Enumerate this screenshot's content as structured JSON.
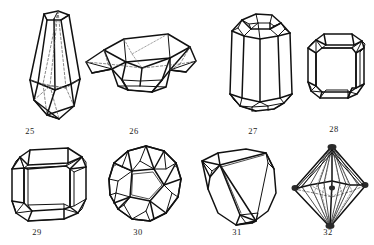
{
  "plate": {
    "title": "Crystal habit line drawings plate",
    "background_color": "#ffffff",
    "ink_color": "#111111",
    "hidden_edge_color": "#666666",
    "width": 374,
    "height": 245,
    "rows": 2,
    "columns": 4,
    "figure_count": 8
  },
  "figures": [
    {
      "number": "25",
      "caption": "25",
      "name": "elongated-dipyramidal-crystal",
      "description": "Tall tapering prismatic crystal with pyramidal termination and hidden rear edges shown dashed",
      "row": 1,
      "column": 1,
      "caption_x": 30,
      "caption_y": 130
    },
    {
      "number": "26",
      "caption": "26",
      "name": "tabular-lenticular-crystal",
      "description": "Wide flattened tabular crystal seen edgewise with beveled faces and dashed interior edges",
      "row": 1,
      "column": 2,
      "caption_x": 134,
      "caption_y": 130
    },
    {
      "number": "27",
      "caption": "27",
      "name": "hexagonal-prism-crystal",
      "description": "Upright hexagonal prism with multifaceted domed terminations top and bottom",
      "row": 1,
      "column": 3,
      "caption_x": 253,
      "caption_y": 130
    },
    {
      "number": "28",
      "caption": "28",
      "name": "beveled-cube-crystal",
      "description": "Short blocky cube with truncated corners and beveled edges",
      "row": 1,
      "column": 4,
      "caption_x": 334,
      "caption_y": 128
    },
    {
      "number": "29",
      "caption": "29",
      "name": "truncated-cube-crystal",
      "description": "Squat cubic crystal with all twelve edges bevel-truncated",
      "row": 2,
      "column": 1,
      "caption_x": 37,
      "caption_y": 231
    },
    {
      "number": "30",
      "caption": "30",
      "name": "dodecahedral-crystal",
      "description": "Rounded polyhedral crystal with many pentagonal faces, dodecahedron-like",
      "row": 2,
      "column": 2,
      "caption_x": 138,
      "caption_y": 231
    },
    {
      "number": "31",
      "caption": "31",
      "name": "rounded-trigonal-crystal",
      "description": "Irregular rounded triangular crystal with small notched faces at two corners",
      "row": 2,
      "column": 3,
      "caption_x": 237,
      "caption_y": 231
    },
    {
      "number": "32",
      "caption": "32",
      "name": "octahedral-crystal",
      "description": "Octahedron with striated shaded faces and dashed hidden rear edges",
      "row": 2,
      "column": 4,
      "caption_x": 328,
      "caption_y": 231
    }
  ]
}
